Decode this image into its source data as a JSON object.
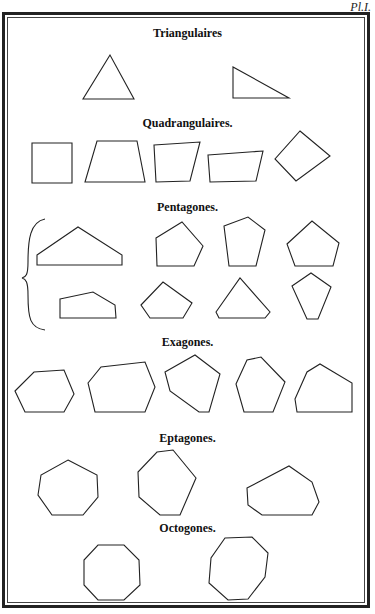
{
  "plate": {
    "label": "Pl.I."
  },
  "sections": [
    {
      "id": "triangulaires",
      "title": "Triangulaires",
      "top": 26
    },
    {
      "id": "quadrangulaires",
      "title": "Quadrangulaires.",
      "top": 116
    },
    {
      "id": "pentagones",
      "title": "Pentagones.",
      "top": 200
    },
    {
      "id": "exagones",
      "title": "Exagones.",
      "top": 335
    },
    {
      "id": "eptagones",
      "title": "Eptagones.",
      "top": 431
    },
    {
      "id": "octogones",
      "title": "Octogones.",
      "top": 521
    }
  ],
  "shapes": {
    "triangulaires": [
      "110,55 83,99 134,99",
      "233,67 233,98 289,98"
    ],
    "quadrangulaires": [
      "32,143 72,143 72,183 32,183",
      "97,141 137,141 145,182 85,182",
      "154,145 200,142 190,181 156,182",
      "208,155 263,151 256,181 210,182",
      "300,131 330,156 296,181 275,159"
    ],
    "pentagones": [
      "37,255 78,227 122,255 122,265 37,265",
      "156,238 182,222 203,246 194,266 157,266",
      "224,226 248,217 265,230 256,266 229,266",
      "287,244 312,221 339,243 333,266 295,266",
      "60,299 93,292 115,305 116,318 60,318",
      "141,305 163,282 192,303 183,318 150,318",
      "216,312 240,278 270,312 265,318 219,318",
      "292,286 311,273 331,287 318,319 307,319"
    ],
    "exagones": [
      "15,391 34,372 64,370 74,394 64,412 25,412",
      "88,383 101,367 145,362 155,387 145,412 95,412",
      "165,372 195,355 220,374 209,412 199,412 170,391",
      "236,384 247,360 261,357 285,382 273,412 244,412",
      "295,399 307,372 320,364 352,383 352,412 297,412"
    ],
    "eptagones": [
      "68,460 97,475 98,497 83,515 52,515 38,495 41,475",
      "157,452 173,450 196,478 180,515 160,515 139,497 138,472",
      "247,488 289,466 312,482 319,502 312,515 262,515 248,505"
    ],
    "octogones": [
      "98,545 124,545 139,560 140,585 124,600 98,600 84,585 84,560",
      "225,538 252,537 268,553 265,577 248,599 228,600 209,583 211,558"
    ]
  },
  "brace": {
    "path": "M45,219 C30,222 28,240 28,262 C28,275 26,277 22,278 C26,279 28,282 28,295 C28,318 30,328 45,330"
  }
}
